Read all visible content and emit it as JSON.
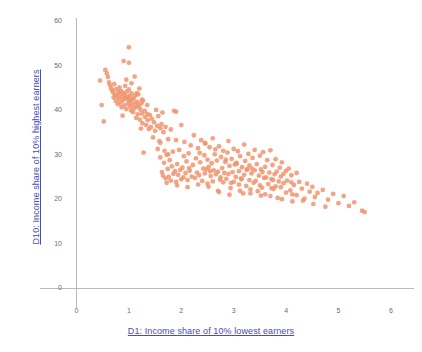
{
  "chart_data": {
    "type": "scatter",
    "title": "",
    "xlabel": "D1: Income share of 10% lowest earners",
    "ylabel": "D10: Income share of 10% highest earners",
    "xlim": [
      0,
      6.2
    ],
    "ylim": [
      0,
      62
    ],
    "xticks": [
      0,
      1,
      2,
      3,
      4,
      5,
      6
    ],
    "yticks": [
      0,
      10,
      20,
      30,
      40,
      50,
      60
    ],
    "xtick_labels": [
      "0",
      "1",
      "2",
      "3",
      "4",
      "5",
      "6"
    ],
    "ytick_labels": [
      "0",
      "10",
      "20",
      "30",
      "40",
      "50",
      "60"
    ],
    "grid": false,
    "legend": null,
    "marker_color": "#F0946E",
    "marker_radius": 2.4,
    "marker_opacity": 0.85,
    "axis_color": "#b9b9b9",
    "label_color": "#4a4ab8",
    "tick_color": "#6b6b6b",
    "background": "#ffffff",
    "series": [
      {
        "name": "countries",
        "points": [
          [
            0.45,
            46.8
          ],
          [
            0.48,
            41.3
          ],
          [
            0.52,
            37.6
          ],
          [
            0.55,
            49.2
          ],
          [
            0.58,
            48.4
          ],
          [
            0.6,
            47.6
          ],
          [
            0.62,
            46.4
          ],
          [
            0.64,
            45.8
          ],
          [
            0.66,
            45.1
          ],
          [
            0.68,
            44.6
          ],
          [
            0.7,
            44.1
          ],
          [
            0.71,
            43.0
          ],
          [
            0.72,
            46.0
          ],
          [
            0.74,
            43.6
          ],
          [
            0.75,
            42.2
          ],
          [
            0.76,
            44.9
          ],
          [
            0.78,
            43.2
          ],
          [
            0.79,
            41.5
          ],
          [
            0.8,
            44.2
          ],
          [
            0.81,
            42.7
          ],
          [
            0.82,
            45.3
          ],
          [
            0.83,
            43.8
          ],
          [
            0.84,
            41.9
          ],
          [
            0.85,
            44.5
          ],
          [
            0.86,
            40.8
          ],
          [
            0.87,
            43.1
          ],
          [
            0.88,
            38.9
          ],
          [
            0.89,
            42.4
          ],
          [
            0.9,
            44.0
          ],
          [
            0.9,
            51.2
          ],
          [
            0.91,
            41.2
          ],
          [
            0.92,
            43.5
          ],
          [
            0.93,
            45.6
          ],
          [
            0.94,
            42.9
          ],
          [
            0.95,
            40.4
          ],
          [
            0.96,
            44.3
          ],
          [
            0.97,
            43.0
          ],
          [
            0.98,
            41.6
          ],
          [
            0.99,
            42.5
          ],
          [
            1.0,
            54.3
          ],
          [
            1.0,
            50.8
          ],
          [
            1.0,
            44.8
          ],
          [
            1.01,
            43.3
          ],
          [
            1.02,
            41.0
          ],
          [
            1.03,
            42.1
          ],
          [
            1.04,
            40.1
          ],
          [
            1.05,
            43.9
          ],
          [
            1.06,
            42.6
          ],
          [
            1.07,
            41.4
          ],
          [
            1.08,
            39.7
          ],
          [
            1.09,
            42.8
          ],
          [
            1.1,
            40.6
          ],
          [
            1.11,
            47.7
          ],
          [
            1.12,
            43.4
          ],
          [
            1.13,
            41.8
          ],
          [
            1.14,
            38.4
          ],
          [
            1.15,
            40.9
          ],
          [
            1.16,
            42.0
          ],
          [
            1.17,
            39.2
          ],
          [
            1.18,
            43.7
          ],
          [
            1.19,
            41.1
          ],
          [
            1.2,
            45.0
          ],
          [
            1.21,
            38.0
          ],
          [
            1.22,
            40.3
          ],
          [
            1.23,
            36.0
          ],
          [
            1.24,
            41.7
          ],
          [
            1.25,
            39.4
          ],
          [
            1.26,
            37.2
          ],
          [
            1.27,
            42.3
          ],
          [
            1.28,
            30.6
          ],
          [
            1.3,
            40.0
          ],
          [
            1.31,
            38.6
          ],
          [
            1.33,
            36.8
          ],
          [
            1.35,
            41.3
          ],
          [
            1.36,
            37.9
          ],
          [
            1.38,
            35.9
          ],
          [
            1.4,
            39.0
          ],
          [
            1.42,
            36.3
          ],
          [
            1.44,
            38.2
          ],
          [
            1.46,
            34.0
          ],
          [
            1.48,
            37.4
          ],
          [
            1.5,
            35.5
          ],
          [
            1.52,
            40.2
          ],
          [
            1.54,
            36.6
          ],
          [
            1.55,
            31.4
          ],
          [
            1.56,
            38.8
          ],
          [
            1.58,
            33.2
          ],
          [
            1.6,
            36.1
          ],
          [
            1.6,
            29.5
          ],
          [
            1.62,
            37.0
          ],
          [
            1.63,
            26.2
          ],
          [
            1.64,
            39.6
          ],
          [
            1.65,
            25.4
          ],
          [
            1.66,
            35.2
          ],
          [
            1.67,
            28.3
          ],
          [
            1.68,
            31.0
          ],
          [
            1.7,
            36.4
          ],
          [
            1.7,
            24.8
          ],
          [
            1.72,
            30.1
          ],
          [
            1.74,
            26.9
          ],
          [
            1.75,
            33.6
          ],
          [
            1.76,
            25.1
          ],
          [
            1.78,
            28.9
          ],
          [
            1.8,
            35.8
          ],
          [
            1.8,
            24.3
          ],
          [
            1.82,
            27.5
          ],
          [
            1.84,
            30.8
          ],
          [
            1.85,
            25.8
          ],
          [
            1.86,
            40.0
          ],
          [
            1.88,
            26.4
          ],
          [
            1.9,
            39.8
          ],
          [
            1.9,
            24.0
          ],
          [
            1.92,
            28.0
          ],
          [
            1.94,
            25.6
          ],
          [
            1.96,
            31.2
          ],
          [
            1.98,
            26.7
          ],
          [
            2.0,
            36.8
          ],
          [
            2.0,
            24.6
          ],
          [
            2.02,
            27.2
          ],
          [
            2.04,
            25.0
          ],
          [
            2.06,
            33.0
          ],
          [
            2.08,
            26.0
          ],
          [
            2.1,
            28.6
          ],
          [
            2.12,
            24.4
          ],
          [
            2.14,
            30.4
          ],
          [
            2.16,
            26.5
          ],
          [
            2.18,
            32.2
          ],
          [
            2.2,
            25.2
          ],
          [
            2.22,
            27.8
          ],
          [
            2.24,
            34.5
          ],
          [
            2.26,
            24.9
          ],
          [
            2.28,
            29.3
          ],
          [
            2.3,
            26.1
          ],
          [
            2.32,
            31.6
          ],
          [
            2.34,
            25.5
          ],
          [
            2.36,
            28.4
          ],
          [
            2.38,
            33.4
          ],
          [
            2.4,
            24.2
          ],
          [
            2.42,
            27.0
          ],
          [
            2.44,
            30.0
          ],
          [
            2.45,
            25.9
          ],
          [
            2.46,
            32.6
          ],
          [
            2.48,
            26.8
          ],
          [
            2.5,
            29.0
          ],
          [
            2.5,
            23.6
          ],
          [
            2.52,
            27.4
          ],
          [
            2.54,
            31.8
          ],
          [
            2.56,
            25.3
          ],
          [
            2.58,
            28.2
          ],
          [
            2.6,
            33.8
          ],
          [
            2.6,
            24.1
          ],
          [
            2.62,
            26.6
          ],
          [
            2.64,
            30.2
          ],
          [
            2.66,
            25.7
          ],
          [
            2.68,
            28.8
          ],
          [
            2.7,
            22.0
          ],
          [
            2.7,
            26.3
          ],
          [
            2.72,
            32.0
          ],
          [
            2.74,
            24.5
          ],
          [
            2.76,
            29.6
          ],
          [
            2.78,
            27.1
          ],
          [
            2.8,
            31.0
          ],
          [
            2.8,
            23.9
          ],
          [
            2.82,
            26.0
          ],
          [
            2.84,
            28.5
          ],
          [
            2.86,
            24.7
          ],
          [
            2.88,
            30.6
          ],
          [
            2.9,
            33.2
          ],
          [
            2.9,
            25.8
          ],
          [
            2.92,
            27.6
          ],
          [
            2.94,
            22.6
          ],
          [
            2.96,
            29.2
          ],
          [
            2.98,
            26.2
          ],
          [
            3.0,
            31.4
          ],
          [
            3.0,
            24.0
          ],
          [
            3.02,
            27.9
          ],
          [
            3.04,
            25.1
          ],
          [
            3.06,
            28.1
          ],
          [
            3.08,
            30.9
          ],
          [
            3.1,
            23.4
          ],
          [
            3.1,
            26.4
          ],
          [
            3.12,
            29.8
          ],
          [
            3.14,
            24.8
          ],
          [
            3.16,
            27.3
          ],
          [
            3.18,
            21.4
          ],
          [
            3.2,
            32.4
          ],
          [
            3.2,
            25.6
          ],
          [
            3.22,
            28.7
          ],
          [
            3.24,
            23.1
          ],
          [
            3.26,
            26.9
          ],
          [
            3.28,
            30.3
          ],
          [
            3.3,
            24.4
          ],
          [
            3.3,
            27.7
          ],
          [
            3.32,
            22.3
          ],
          [
            3.34,
            25.9
          ],
          [
            3.36,
            29.4
          ],
          [
            3.38,
            23.8
          ],
          [
            3.4,
            26.6
          ],
          [
            3.4,
            31.2
          ],
          [
            3.42,
            24.2
          ],
          [
            3.44,
            28.0
          ],
          [
            3.46,
            21.9
          ],
          [
            3.48,
            25.4
          ],
          [
            3.5,
            29.9
          ],
          [
            3.5,
            23.2
          ],
          [
            3.52,
            26.8
          ],
          [
            3.54,
            22.7
          ],
          [
            3.56,
            30.7
          ],
          [
            3.58,
            24.9
          ],
          [
            3.6,
            27.4
          ],
          [
            3.6,
            21.2
          ],
          [
            3.62,
            25.0
          ],
          [
            3.64,
            28.9
          ],
          [
            3.66,
            23.5
          ],
          [
            3.68,
            26.1
          ],
          [
            3.7,
            31.1
          ],
          [
            3.7,
            20.8
          ],
          [
            3.72,
            24.6
          ],
          [
            3.74,
            27.8
          ],
          [
            3.76,
            22.4
          ],
          [
            3.78,
            25.7
          ],
          [
            3.8,
            29.1
          ],
          [
            3.8,
            23.0
          ],
          [
            3.82,
            26.3
          ],
          [
            3.84,
            20.4
          ],
          [
            3.86,
            24.1
          ],
          [
            3.88,
            27.2
          ],
          [
            3.9,
            22.8
          ],
          [
            3.9,
            25.2
          ],
          [
            3.92,
            28.4
          ],
          [
            3.95,
            23.7
          ],
          [
            4.0,
            26.5
          ],
          [
            4.0,
            21.6
          ],
          [
            4.02,
            24.3
          ],
          [
            4.05,
            27.0
          ],
          [
            4.08,
            22.1
          ],
          [
            4.1,
            25.5
          ],
          [
            4.12,
            19.6
          ],
          [
            4.15,
            23.3
          ],
          [
            4.2,
            26.0
          ],
          [
            4.2,
            21.0
          ],
          [
            4.25,
            24.0
          ],
          [
            4.3,
            22.5
          ],
          [
            4.35,
            20.2
          ],
          [
            4.4,
            23.6
          ],
          [
            4.45,
            21.8
          ],
          [
            4.5,
            22.9
          ],
          [
            4.55,
            20.6
          ],
          [
            4.6,
            21.5
          ],
          [
            4.7,
            22.2
          ],
          [
            4.75,
            18.4
          ],
          [
            4.8,
            20.0
          ],
          [
            4.9,
            21.3
          ],
          [
            5.0,
            19.2
          ],
          [
            5.1,
            20.8
          ],
          [
            5.2,
            18.6
          ],
          [
            5.3,
            19.4
          ],
          [
            5.45,
            17.5
          ],
          [
            5.5,
            17.2
          ],
          [
            1.6,
            32.8
          ],
          [
            1.75,
            30.2
          ],
          [
            1.9,
            33.4
          ],
          [
            2.05,
            29.8
          ],
          [
            2.15,
            27.1
          ],
          [
            2.35,
            30.5
          ],
          [
            2.55,
            26.4
          ],
          [
            2.75,
            25.0
          ],
          [
            2.95,
            23.8
          ],
          [
            3.15,
            24.6
          ],
          [
            3.35,
            27.0
          ],
          [
            3.55,
            26.2
          ],
          [
            3.75,
            24.4
          ],
          [
            3.95,
            25.8
          ],
          [
            4.1,
            23.9
          ],
          [
            0.95,
            47.0
          ],
          [
            1.05,
            46.2
          ],
          [
            1.15,
            44.0
          ],
          [
            1.25,
            42.5
          ],
          [
            1.35,
            39.3
          ],
          [
            2.45,
            32.8
          ],
          [
            2.65,
            31.3
          ],
          [
            2.85,
            29.0
          ],
          [
            3.05,
            28.3
          ],
          [
            3.25,
            26.7
          ],
          [
            1.72,
            23.8
          ],
          [
            1.92,
            23.2
          ],
          [
            2.12,
            22.8
          ],
          [
            2.32,
            23.4
          ],
          [
            2.52,
            22.9
          ],
          [
            2.72,
            21.7
          ],
          [
            2.92,
            21.1
          ],
          [
            3.12,
            22.0
          ],
          [
            3.32,
            21.4
          ],
          [
            3.52,
            20.9
          ],
          [
            3.72,
            22.6
          ],
          [
            3.92,
            20.1
          ],
          [
            4.12,
            21.2
          ],
          [
            4.32,
            19.8
          ],
          [
            4.52,
            19.0
          ]
        ]
      }
    ]
  },
  "axes": {
    "x_title": "D1: Income share of 10% lowest earners",
    "y_title": "D10: Income share of 10% highest earners"
  }
}
